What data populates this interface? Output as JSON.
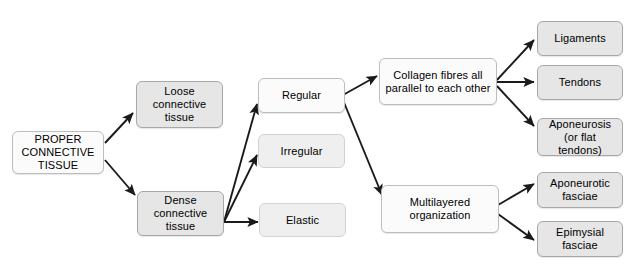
{
  "diagram": {
    "background_color": "#ffffff",
    "node_fill_gray": "#e6e6e6",
    "node_fill_light": "#fbfbfb",
    "node_border_color": "#a8a8a8",
    "edge_color": "#1a1a1a",
    "text_color": "#000000"
  },
  "nodes": {
    "root": {
      "label": "PROPER\nCONNECTIVE\nTISSUE"
    },
    "loose": {
      "label": "Loose\nconnective\ntissue"
    },
    "dense": {
      "label": "Dense\nconnective\ntissue"
    },
    "regular": {
      "label": "Regular"
    },
    "irregular": {
      "label": "Irregular"
    },
    "elastic": {
      "label": "Elastic"
    },
    "collagen": {
      "label": "Collagen fibres all\nparallel to each other"
    },
    "multilayered": {
      "label": "Multilayered\norganization"
    },
    "ligaments": {
      "label": "Ligaments"
    },
    "tendons": {
      "label": "Tendons"
    },
    "aponeurosis": {
      "label": "Aponeurosis\n(or flat tendons)"
    },
    "aponeurotic_fasciae": {
      "label": "Aponeurotic\nfasciae"
    },
    "epimysial_fasciae": {
      "label": "Epimysial\nfasciae"
    }
  },
  "edges": [
    {
      "from": "root",
      "to": "loose"
    },
    {
      "from": "root",
      "to": "dense"
    },
    {
      "from": "dense",
      "to": "regular"
    },
    {
      "from": "dense",
      "to": "irregular"
    },
    {
      "from": "dense",
      "to": "elastic"
    },
    {
      "from": "regular",
      "to": "collagen"
    },
    {
      "from": "regular",
      "to": "multilayered"
    },
    {
      "from": "collagen",
      "to": "ligaments"
    },
    {
      "from": "collagen",
      "to": "tendons"
    },
    {
      "from": "collagen",
      "to": "aponeurosis"
    },
    {
      "from": "multilayered",
      "to": "aponeurotic_fasciae"
    },
    {
      "from": "multilayered",
      "to": "epimysial_fasciae"
    }
  ]
}
